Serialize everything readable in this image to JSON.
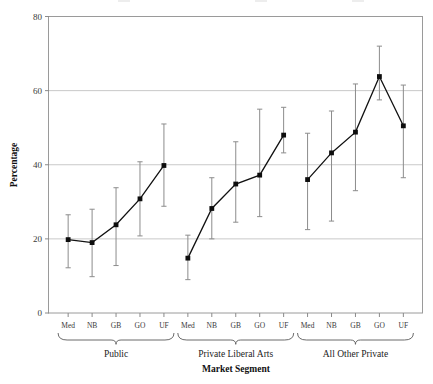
{
  "chart": {
    "type": "line",
    "xlabel": "Market Segment",
    "ylabel": "Percentage"
  },
  "axes": {
    "y_ticks": [
      "0",
      "20",
      "40",
      "60",
      "80"
    ],
    "y_values": [
      0,
      20,
      40,
      60,
      80
    ],
    "ylim": [
      0,
      80
    ],
    "gridlines_at": [
      20,
      40,
      60
    ]
  },
  "chart_data": {
    "type": "line",
    "title": "",
    "subtitle": "",
    "xlabel": "Market Segment",
    "ylabel": "Percentage",
    "ylim": [
      0,
      80
    ],
    "yticks": [
      0,
      20,
      40,
      60,
      80
    ],
    "grid": "horizontal",
    "legend": "none",
    "error_bars": "asymmetric-vertical",
    "groups": [
      {
        "name": "Public",
        "categories": [
          "Med",
          "NB",
          "GB",
          "GO",
          "UF"
        ],
        "values": [
          19.8,
          19.0,
          23.8,
          30.8,
          39.8
        ],
        "lower": [
          12.2,
          9.8,
          12.8,
          20.8,
          28.8
        ],
        "upper": [
          26.5,
          28.0,
          33.8,
          40.8,
          51.0
        ]
      },
      {
        "name": "Private Liberal Arts",
        "categories": [
          "Med",
          "NB",
          "GB",
          "GO",
          "UF"
        ],
        "values": [
          14.8,
          28.2,
          34.8,
          37.2,
          48.0
        ],
        "lower": [
          9.0,
          20.0,
          24.5,
          26.0,
          43.2
        ],
        "upper": [
          21.0,
          36.5,
          46.2,
          55.0,
          55.5
        ]
      },
      {
        "name": "All Other Private",
        "categories": [
          "Med",
          "NB",
          "GB",
          "GO",
          "UF"
        ],
        "values": [
          36.0,
          43.2,
          48.8,
          63.8,
          50.5
        ],
        "lower": [
          22.5,
          24.8,
          33.0,
          57.5,
          36.5
        ],
        "upper": [
          48.5,
          54.5,
          61.8,
          72.0,
          61.5
        ]
      }
    ],
    "x_tick_labels": [
      "Med",
      "NB",
      "GB",
      "GO",
      "UF",
      "Med",
      "NB",
      "GB",
      "GO",
      "UF",
      "Med",
      "NB",
      "GB",
      "GO",
      "UF"
    ],
    "group_labels": [
      "Public",
      "Private Liberal Arts",
      "All Other Private"
    ]
  },
  "colors": {
    "line": "#111111",
    "marker": "#0d0d0d",
    "error_bar": "#8c8c8c",
    "grid": "#c9c9c9",
    "frame": "#9a9a9a",
    "background": "#ffffff"
  }
}
